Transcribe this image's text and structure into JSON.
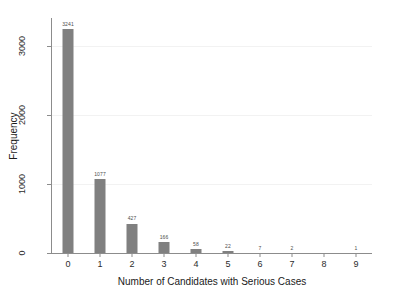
{
  "chart_data": {
    "type": "bar",
    "title": "",
    "xlabel": "Number of Candidates with Serious Cases",
    "ylabel": "Frequency",
    "categories": [
      "0",
      "1",
      "2",
      "3",
      "4",
      "5",
      "6",
      "7",
      "8",
      "9"
    ],
    "values": [
      3241,
      1077,
      427,
      166,
      58,
      22,
      7,
      2,
      0,
      1
    ],
    "bar_labels": [
      "3241",
      "1077",
      "427",
      "166",
      "58",
      "22",
      "7",
      "2",
      "",
      "1"
    ],
    "xticks": [
      "0",
      "1",
      "2",
      "3",
      "4",
      "5",
      "6",
      "7",
      "8",
      "9"
    ],
    "yticks": [
      "0",
      "1000",
      "2000",
      "3000"
    ],
    "ytick_values": [
      0,
      1000,
      2000,
      3000
    ],
    "ylim": [
      0,
      3400
    ],
    "xlim": [
      -0.5,
      9.5
    ],
    "grid": true,
    "legend": "none",
    "bar_color": "#808080",
    "background_color": "#ffffff",
    "axis_color": "#8c8c8c",
    "gridline_color": "#f2f2f2"
  }
}
